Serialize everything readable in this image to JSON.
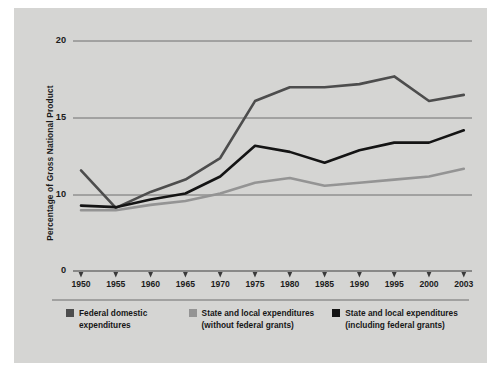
{
  "chart_data": {
    "type": "line",
    "title": "",
    "xlabel": "",
    "ylabel": "Percentage of Gross National Product",
    "x": [
      1950,
      1955,
      1960,
      1965,
      1970,
      1975,
      1980,
      1985,
      1990,
      1995,
      2000,
      2003
    ],
    "xtick_labels": [
      "1950",
      "1955",
      "1960",
      "1965",
      "1970",
      "1975",
      "1980",
      "1985",
      "1990",
      "1995",
      "2000",
      "2003"
    ],
    "ytick_labels": [
      "0",
      "10",
      "15",
      "20"
    ],
    "ytick_values": [
      0,
      10,
      15,
      20
    ],
    "ylim": [
      0,
      20
    ],
    "grid": "horizontal",
    "axis_break": "y-axis compressed between 0 and 10",
    "legend_position": "below",
    "series": [
      {
        "name": "Federal domestic expenditures",
        "label_line1": "Federal domestic",
        "label_line2": "expenditures",
        "color": "#4d4d4d",
        "values": [
          11.6,
          8.3,
          10.2,
          11.0,
          12.4,
          16.1,
          17.0,
          17.0,
          17.2,
          17.7,
          16.1,
          16.5
        ]
      },
      {
        "name": "State and local expenditures (without federal grants)",
        "label_line1": "State and local expenditures",
        "label_line2": "(without federal grants)",
        "color": "#949494",
        "values": [
          8.0,
          8.0,
          8.7,
          9.2,
          10.1,
          10.8,
          11.1,
          10.6,
          10.8,
          11.0,
          11.2,
          11.7
        ]
      },
      {
        "name": "State and local expenditures (including federal grants)",
        "label_line1": "State and local expenditures",
        "label_line2": "(including federal grants)",
        "color": "#141414",
        "values": [
          8.6,
          8.4,
          9.4,
          10.1,
          11.2,
          13.2,
          12.8,
          12.1,
          12.9,
          13.4,
          13.4,
          14.2
        ]
      }
    ]
  },
  "figure": {
    "background_color": "#d5d5d3",
    "page_background": "#ffffff",
    "grid_color": "#6f6f6f",
    "axis_color": "#6f6f6f"
  }
}
